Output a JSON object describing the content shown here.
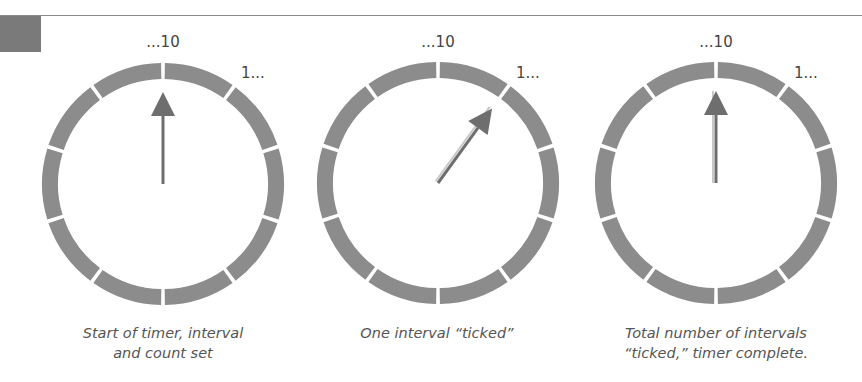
{
  "colors": {
    "ring": "#8c8c8c",
    "divider": "#ffffff",
    "arrow": "#6e6e6e",
    "ghost": "#c8c8c8",
    "text": "#555555",
    "rule": "#8a8a8a",
    "corner_block": "#7a7a7a"
  },
  "dials": [
    {
      "name": "dial-start",
      "segments": 10,
      "end_label": "...10",
      "start_label": "1...",
      "pointer_position_intervals": 0,
      "ghost_trail": false,
      "caption_lines": [
        "Start of timer, interval",
        "and count set"
      ]
    },
    {
      "name": "dial-one-tick",
      "segments": 10,
      "end_label": "...10",
      "start_label": "1...",
      "pointer_position_intervals": 1,
      "ghost_trail": true,
      "caption_lines": [
        "One interval “ticked”"
      ]
    },
    {
      "name": "dial-complete",
      "segments": 10,
      "end_label": "...10",
      "start_label": "1...",
      "pointer_position_intervals": 10,
      "ghost_trail": true,
      "caption_lines": [
        "Total number of intervals",
        "“ticked,” timer complete."
      ]
    }
  ]
}
